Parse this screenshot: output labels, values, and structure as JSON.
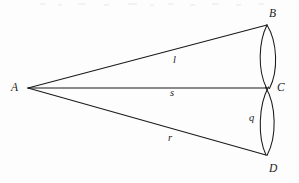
{
  "figure": {
    "background_color": "#fdfdfd",
    "stroke_color": "#1a1a1a",
    "canvas": {
      "width": 299,
      "height": 183
    },
    "vertices": [
      {
        "id": "A",
        "label": "A",
        "x": 28,
        "y": 88,
        "label_x": 11,
        "label_y": 82
      },
      {
        "id": "B",
        "label": "B",
        "x": 267,
        "y": 25,
        "label_x": 269,
        "label_y": 8
      },
      {
        "id": "C",
        "label": "C",
        "x": 268,
        "y": 88,
        "label_x": 277,
        "label_y": 82
      },
      {
        "id": "D",
        "label": "D",
        "x": 266,
        "y": 155,
        "label_x": 269,
        "label_y": 163
      }
    ],
    "segments": [
      {
        "id": "l",
        "label": "l",
        "from": "A",
        "to": "B",
        "label_x": 173,
        "label_y": 55
      },
      {
        "id": "s",
        "label": "s",
        "from": "A",
        "to": "C",
        "label_x": 170,
        "label_y": 88
      },
      {
        "id": "r",
        "label": "r",
        "from": "A",
        "to": "D",
        "label_x": 168,
        "label_y": 133
      },
      {
        "id": "q",
        "label": "q",
        "from": "C",
        "to": "D",
        "label_x": 249,
        "label_y": 113
      }
    ],
    "lenses": [
      {
        "id": "upper-lens",
        "between": [
          "B",
          "C"
        ],
        "left_x": 258,
        "right_x": 278,
        "top_y": 25,
        "bottom_y": 88
      },
      {
        "id": "lower-lens",
        "between": [
          "C",
          "D"
        ],
        "left_x": 258,
        "right_x": 277,
        "top_y": 88,
        "bottom_y": 155
      }
    ]
  }
}
